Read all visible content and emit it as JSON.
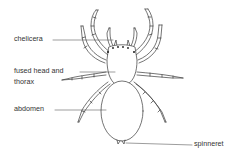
{
  "diagram": {
    "labels": {
      "chelicera": "chelicera",
      "head_thorax_line1": "fused head and",
      "head_thorax_line2": "thorax",
      "abdomen": "abdomen",
      "spinneret": "spinneret"
    },
    "colors": {
      "stroke": "#3a3a3a",
      "text": "#333333",
      "background": "#ffffff"
    }
  }
}
